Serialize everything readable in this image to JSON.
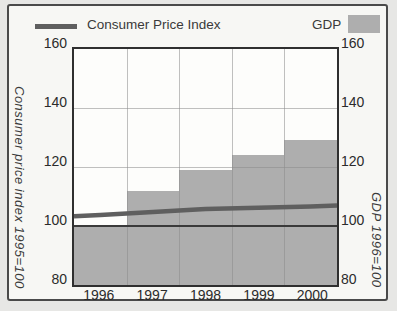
{
  "legend": {
    "cpi_label": "Consumer Price Index",
    "gdp_label": "GDP"
  },
  "axes": {
    "left_title": "Consumer price index 1995=100",
    "right_title": "GDP 1996=100",
    "yticks": [
      "160",
      "140",
      "120",
      "100",
      "80"
    ],
    "categories": [
      "1996",
      "1997",
      "1998",
      "1999",
      "2000"
    ]
  },
  "chart_data": {
    "type": "bar",
    "categories": [
      "1996",
      "1997",
      "1998",
      "1999",
      "2000"
    ],
    "series": [
      {
        "name": "GDP",
        "type": "bar",
        "values": [
          100,
          112,
          119,
          124,
          129
        ]
      },
      {
        "name": "Consumer Price Index",
        "type": "line",
        "values": [
          103.7,
          104.7,
          105.8,
          106.2,
          106.6
        ],
        "edge_left": 103.3,
        "edge_right": 106.9
      }
    ],
    "ylim": [
      80,
      160
    ],
    "yticks": [
      160,
      140,
      120,
      100,
      80
    ],
    "reference_line": 100,
    "grid": true,
    "legend_position": "top",
    "left_ylabel": "Consumer price index 1995=100",
    "right_ylabel": "GDP 1996=100"
  },
  "colors": {
    "bar": "#aeaeae",
    "bar-dot": "#9c9c9c",
    "line": "#5f5f5f",
    "ref": "#3a3a3a",
    "frame": "#2f2f2f",
    "grid": "#8c8c8c"
  }
}
